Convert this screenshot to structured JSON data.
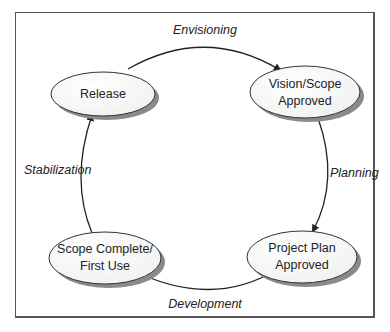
{
  "diagram": {
    "type": "cycle",
    "nodes": [
      {
        "id": "release",
        "lines": [
          "Release"
        ],
        "cx": 103,
        "cy": 94,
        "rx": 52,
        "ry": 22
      },
      {
        "id": "vision_scope",
        "lines": [
          "Vision/Scope",
          "Approved"
        ],
        "cx": 305,
        "cy": 92,
        "rx": 55,
        "ry": 26
      },
      {
        "id": "project_plan",
        "lines": [
          "Project Plan",
          "Approved"
        ],
        "cx": 302,
        "cy": 257,
        "rx": 55,
        "ry": 26
      },
      {
        "id": "scope_complete",
        "lines": [
          "Scope Complete/",
          "First Use"
        ],
        "cx": 105,
        "cy": 258,
        "rx": 56,
        "ry": 26
      }
    ],
    "edges": [
      {
        "from": "release",
        "to": "vision_scope",
        "label": "Envisioning"
      },
      {
        "from": "vision_scope",
        "to": "project_plan",
        "label": "Planning"
      },
      {
        "from": "project_plan",
        "to": "scope_complete",
        "label": "Development"
      },
      {
        "from": "scope_complete",
        "to": "release",
        "label": "Stabilization"
      }
    ],
    "colors": {
      "ellipse_fill": "#ffffff",
      "ellipse_stroke": "#333333",
      "shadow": "#8a8a8a",
      "arrow": "#222222",
      "frame": "#555555"
    }
  },
  "labels": {
    "release": "Release",
    "vision_1": "Vision/Scope",
    "vision_2": "Approved",
    "plan_1": "Project Plan",
    "plan_2": "Approved",
    "scope_1": "Scope Complete/",
    "scope_2": "First Use",
    "envisioning": "Envisioning",
    "planning": "Planning",
    "development": "Development",
    "stabilization": "Stabilization"
  }
}
